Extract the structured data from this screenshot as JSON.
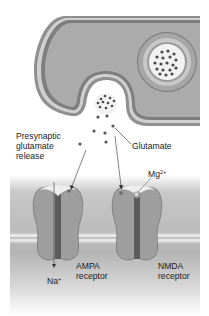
{
  "figure": {
    "labels": {
      "presynaptic_release": [
        "Presynaptic",
        "glutamate",
        "release"
      ],
      "glutamate": "Glutamate",
      "mg_ion": "Mg",
      "mg_charge": "2+",
      "ampa": [
        "AMPA",
        "receptor"
      ],
      "nmda": [
        "NMDA",
        "receptor"
      ],
      "na_ion": "Na",
      "na_charge": "+"
    },
    "colors": {
      "terminal_fill": "#a9a9a9",
      "membrane_outer": "#8a8a8a",
      "membrane_inner": "#d9d9d9",
      "vesicle_fill": "#f2f2f2",
      "molecule": "#4a4a4a",
      "receptor_fill": "#9c9c9c",
      "receptor_pore": "#5a5a5a",
      "postsynaptic_bg": "#b8b8b8",
      "membrane_band": "#dcdcdc"
    }
  }
}
